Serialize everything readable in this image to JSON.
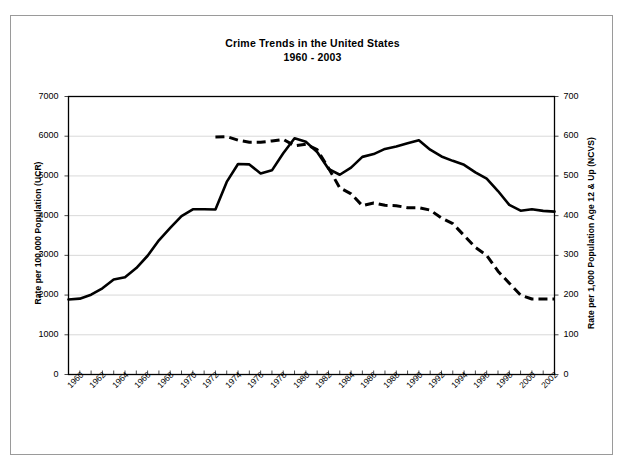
{
  "chart_data": {
    "type": "line",
    "title": "Crime Trends in the United States",
    "subtitle": "1960 - 2003",
    "xlabel": "",
    "ylabel": "Rate per 100,000 Population (UCR)",
    "ylabel_right": "Rate per 1,000 Population Age 12 & Up (NCVS)",
    "grid": true,
    "legend": "none",
    "xlim": [
      1960,
      2003
    ],
    "ylim": [
      0,
      7000
    ],
    "ylim_right": [
      0,
      700
    ],
    "yticks": [
      0,
      1000,
      2000,
      3000,
      4000,
      5000,
      6000,
      7000
    ],
    "yticks_right": [
      0,
      100,
      200,
      300,
      400,
      500,
      600,
      700
    ],
    "xticks": [
      1960,
      1962,
      1964,
      1966,
      1968,
      1970,
      1972,
      1974,
      1976,
      1978,
      1980,
      1982,
      1984,
      1986,
      1988,
      1990,
      1992,
      1994,
      1996,
      1998,
      2000,
      2002
    ],
    "x": [
      1960,
      1961,
      1962,
      1963,
      1964,
      1965,
      1966,
      1967,
      1968,
      1969,
      1970,
      1971,
      1972,
      1973,
      1974,
      1975,
      1976,
      1977,
      1978,
      1979,
      1980,
      1981,
      1982,
      1983,
      1984,
      1985,
      1986,
      1987,
      1988,
      1989,
      1990,
      1991,
      1992,
      1993,
      1994,
      1995,
      1996,
      1997,
      1998,
      1999,
      2000,
      2001,
      2002,
      2003
    ],
    "series": [
      {
        "name": "UCR",
        "style": "solid",
        "color": "#000000",
        "axis": "left",
        "values": [
          1890,
          1910,
          2010,
          2170,
          2390,
          2450,
          2680,
          2990,
          3380,
          3690,
          3990,
          4160,
          4160,
          4155,
          4850,
          5300,
          5290,
          5060,
          5140,
          5570,
          5950,
          5860,
          5600,
          5180,
          5030,
          5210,
          5480,
          5550,
          5680,
          5740,
          5820,
          5900,
          5660,
          5490,
          5380,
          5280,
          5090,
          4930,
          4620,
          4270,
          4125,
          4160,
          4120,
          4100
        ]
      },
      {
        "name": "NCVS",
        "style": "dashed",
        "color": "#000000",
        "axis": "right",
        "values": [
          null,
          null,
          null,
          null,
          null,
          null,
          null,
          null,
          null,
          null,
          null,
          null,
          null,
          598,
          599,
          590,
          585,
          585,
          588,
          592,
          576,
          580,
          566,
          520,
          470,
          455,
          425,
          432,
          426,
          425,
          420,
          420,
          414,
          394,
          380,
          350,
          320,
          300,
          260,
          230,
          200,
          190,
          190,
          190
        ]
      }
    ]
  },
  "axes": {
    "left_title": "Rate per 100,000 Population (UCR)",
    "right_title": "Rate per 1,000 Population Age 12 & Up (NCVS)",
    "left_ticks": [
      "7000",
      "6000",
      "5000",
      "4000",
      "3000",
      "2000",
      "1000",
      "0"
    ],
    "right_ticks": [
      "700",
      "600",
      "500",
      "400",
      "300",
      "200",
      "100",
      "0"
    ],
    "x_ticks": [
      "1960",
      "1962",
      "1964",
      "1966",
      "1968",
      "1970",
      "1972",
      "1974",
      "1976",
      "1978",
      "1980",
      "1982",
      "1984",
      "1986",
      "1988",
      "1990",
      "1992",
      "1994",
      "1996",
      "1998",
      "2000",
      "2002"
    ]
  },
  "header": {
    "title": "Crime Trends in the United States",
    "subtitle": "1960 - 2003"
  },
  "colors": {
    "series": "#000000",
    "grid": "#d9d9d9",
    "frame": "#000000",
    "border": "#9a9a9a",
    "background": "#ffffff"
  }
}
